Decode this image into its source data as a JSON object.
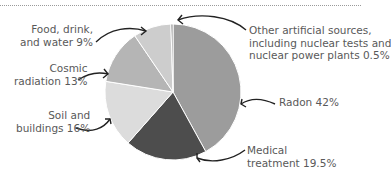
{
  "chart_data": {
    "type": "pie",
    "title": "",
    "slices": [
      {
        "label": "Radon",
        "value": 42,
        "color": "#9c9c9c"
      },
      {
        "label": "Medical treatment",
        "value": 19.5,
        "color": "#4d4d4d"
      },
      {
        "label": "Soil and buildings",
        "value": 16,
        "color": "#dcdcdc"
      },
      {
        "label": "Cosmic radiation",
        "value": 13,
        "color": "#b5b5b5"
      },
      {
        "label": "Food, drink, and water",
        "value": 9,
        "color": "#cdcdcd"
      },
      {
        "label": "Other artificial sources, including nuclear tests and nuclear power plants",
        "value": 0.5,
        "color": "#8a8a8a"
      }
    ],
    "start_angle_deg": 0,
    "direction": "clockwise"
  },
  "labels": {
    "food": [
      "Food, drink,",
      "and water 9%"
    ],
    "cosmic": [
      "Cosmic",
      "radiation 13%"
    ],
    "soil": [
      "Soil and",
      "buildings 16%"
    ],
    "other": [
      "Other artificial sources,",
      "including nuclear tests and",
      "nuclear power plants 0.5%"
    ],
    "radon": [
      "Radon 42%"
    ],
    "medical": [
      "Medical",
      "treatment 19.5%"
    ]
  }
}
